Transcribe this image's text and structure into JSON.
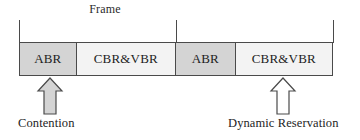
{
  "diagram": {
    "frame_label": "Frame",
    "colors": {
      "abr_fill": "#d4d4d4",
      "cbr_fill": "#f3f3f3",
      "stroke": "#4a4a4a",
      "text": "#1d1d1d",
      "arrow_filled": "#d4d4d4",
      "arrow_hollow": "#ffffff",
      "background": "#ffffff"
    },
    "ticks": [
      {
        "name": "frame-start-tick",
        "x": 19
      },
      {
        "name": "frame-divider-tick",
        "x": 176
      },
      {
        "name": "frame-end-tick",
        "x": 333
      }
    ],
    "cells": [
      {
        "label": "ABR",
        "type": "abr",
        "width": 57
      },
      {
        "label": "CBR&VBR",
        "type": "cbr",
        "width": 100
      },
      {
        "label": "ABR",
        "type": "abr",
        "width": 60
      },
      {
        "label": "CBR&VBR",
        "type": "cbr",
        "width": 97
      }
    ],
    "arrows": [
      {
        "name": "contention-arrow",
        "style": "filled",
        "x": 35,
        "y": 76
      },
      {
        "name": "dynamic-reservation-arrow",
        "style": "hollow",
        "x": 268,
        "y": 76
      }
    ],
    "annotations": [
      {
        "name": "contention-label",
        "text": "Contention",
        "x": 18,
        "y": 116
      },
      {
        "name": "dynamic-reservation-label",
        "text": "Dynamic Reservation",
        "x": 228,
        "y": 116
      }
    ]
  }
}
